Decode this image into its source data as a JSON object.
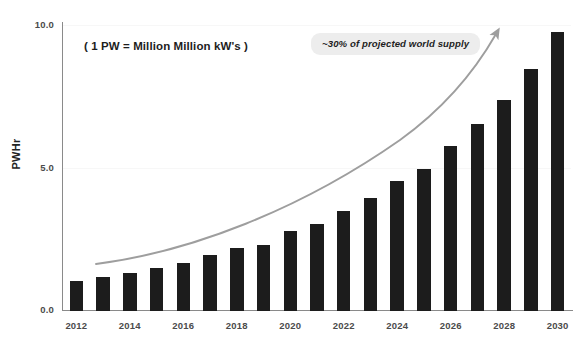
{
  "chart_data": {
    "type": "bar",
    "title": "",
    "xlabel": "",
    "ylabel": "PWHr",
    "ylim": [
      0.0,
      10.0
    ],
    "xlim": [
      2012,
      2030
    ],
    "grid": true,
    "legend": "none",
    "bar_color": "#1c1c1c",
    "axis_color": "#8a8a8a",
    "categories": [
      "2012",
      "2013",
      "2014",
      "2015",
      "2016",
      "2017",
      "2018",
      "2019",
      "2020",
      "2021",
      "2022",
      "2023",
      "2024",
      "2025",
      "2026",
      "2027",
      "2028",
      "2029",
      "2030"
    ],
    "values": [
      1.05,
      1.2,
      1.35,
      1.5,
      1.7,
      1.95,
      2.2,
      2.3,
      2.8,
      3.05,
      3.5,
      3.95,
      4.55,
      5.0,
      5.8,
      6.55,
      7.4,
      8.5,
      9.8
    ],
    "y_ticks": [
      "0.0",
      "5.0",
      "10.0"
    ],
    "y_tick_values": [
      0.0,
      5.0,
      10.0
    ],
    "x_tick_labels": [
      "2012",
      "2014",
      "2016",
      "2018",
      "2020",
      "2022",
      "2024",
      "2026",
      "2028",
      "2030"
    ],
    "x_tick_values": [
      2012,
      2014,
      2016,
      2018,
      2020,
      2022,
      2024,
      2026,
      2028,
      2030
    ],
    "annotations": [
      {
        "name": "formula-note",
        "text": "( 1 PW = Million Million kW's )",
        "style": "plain-bold"
      },
      {
        "name": "supply-callout",
        "text": "~30% of projected world supply",
        "style": "italic-badge",
        "badge_color": "#ededed"
      }
    ],
    "trend_arrow": {
      "name": "growth-trend-arrow",
      "color": "#9e9e9e",
      "from": [
        96,
        263
      ],
      "to": [
        500,
        26
      ]
    }
  }
}
